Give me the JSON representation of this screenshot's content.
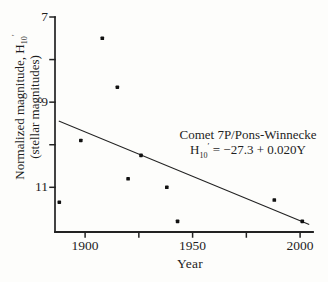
{
  "page": {
    "background_color": "#fdfdfb",
    "ink_color": "#222222"
  },
  "chart_data": {
    "type": "scatter",
    "title": "",
    "xlabel": "Year",
    "ylabel": "Normalized magnitude, H10′ (stellar magnitudes)",
    "ylabel_pre": "Normalized magnitude, H",
    "ylabel_sub": "10",
    "ylabel_prime": "′",
    "ylabel_line2": "(stellar magnitudes)",
    "xlim": [
      1886,
      2006
    ],
    "ylim": [
      7,
      12.05
    ],
    "y_axis_inverted": true,
    "grid": false,
    "x_major_ticks": [
      1900,
      1950,
      2000
    ],
    "x_minor_ticks": [
      1925,
      1975
    ],
    "x_tick_labels": [
      "1900",
      "1950",
      "2000"
    ],
    "y_major_ticks": [
      7,
      9,
      11
    ],
    "y_minor_ticks": [
      8,
      10
    ],
    "y_tick_labels": [
      "7",
      "9",
      "11"
    ],
    "series": [
      {
        "name": "observed apparitions",
        "marker": "square",
        "x": [
          1888,
          1898,
          1908,
          1915,
          1920,
          1926,
          1938,
          1943,
          1988,
          2001
        ],
        "y": [
          11.35,
          9.9,
          7.5,
          8.65,
          10.8,
          10.25,
          11.0,
          11.8,
          11.3,
          11.8
        ]
      }
    ],
    "trendline": {
      "x_start": 1888,
      "y_start": 9.45,
      "x_end": 2004,
      "y_end": 11.87
    },
    "annotation": {
      "line1": "Comet 7P/Pons-Winnecke",
      "eq_pre": "H",
      "eq_sub": "10",
      "eq_prime": "′",
      "eq_rest": " = −27.3 + 0.020Y"
    }
  }
}
